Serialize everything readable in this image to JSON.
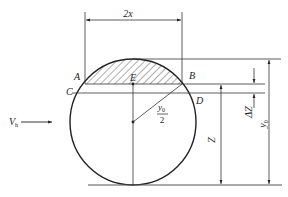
{
  "diagram": {
    "type": "geometry",
    "colors": {
      "stroke": "#222222",
      "thin": "#444444",
      "background": "#ffffff"
    },
    "labels": {
      "width": "2x",
      "point_a": "A",
      "point_b": "B",
      "point_c": "C",
      "point_d": "D",
      "point_e": "E",
      "radius_num": "y",
      "radius_sub": "0",
      "radius_den": "2",
      "velocity": "V",
      "velocity_sub": "h",
      "z": "Z",
      "delta_z": "ΔZ",
      "y0": "y",
      "y0_sub": "0"
    },
    "geometry": {
      "circle_center": [
        133,
        122
      ],
      "circle_radius": 63,
      "chord_ab_y": 84,
      "chord_cd_y": 93,
      "baseline_y": 185
    }
  }
}
